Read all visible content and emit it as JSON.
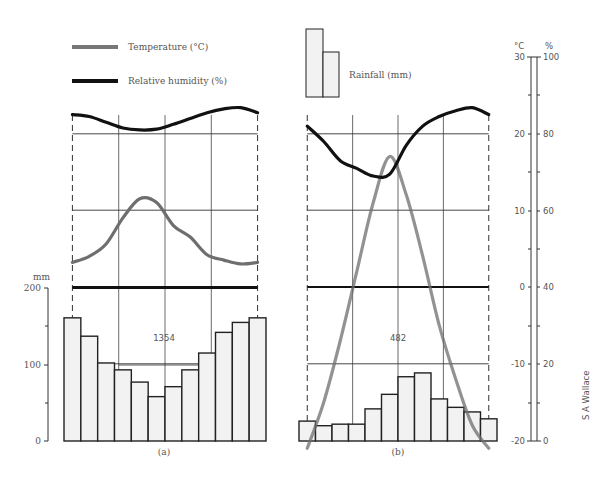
{
  "legend": {
    "temperature_label": "Temperature (°C)",
    "humidity_label": "Relative humidity (%)",
    "rainfall_label": "Rainfall (mm)"
  },
  "axes": {
    "left_unit": "mm",
    "left_ticks": [
      "200",
      "100",
      "0"
    ],
    "right_temp_unit": "°C",
    "right_hum_unit": "%",
    "right_temp_ticks": [
      "30",
      "20",
      "10",
      "0",
      "-10",
      "-20"
    ],
    "right_hum_ticks": [
      "100",
      "80",
      "60",
      "40",
      "20",
      "0"
    ]
  },
  "panels": [
    {
      "label": "(a)",
      "total_label": "1354"
    },
    {
      "label": "(b)",
      "total_label": "482"
    }
  ],
  "credit": "S A Wallace",
  "colors": {
    "temperature": "#6e6e6e",
    "humidity": "#111111",
    "bar_fill": "#f2f2f2",
    "bar_stroke": "#222222"
  },
  "chart_data": [
    {
      "type": "bar+line",
      "title": "(a)",
      "categories": [
        "J",
        "F",
        "M",
        "A",
        "M",
        "J",
        "J",
        "A",
        "S",
        "O",
        "N",
        "D"
      ],
      "annotation": "1354",
      "series": [
        {
          "name": "Rainfall (mm)",
          "type": "bar",
          "axis": "left",
          "values": [
            161,
            137,
            102,
            93,
            77,
            58,
            71,
            93,
            115,
            142,
            155,
            161
          ]
        },
        {
          "name": "Temperature (°C)",
          "type": "line",
          "axis": "right_temp",
          "values": [
            3.2,
            4,
            5.6,
            9,
            11.5,
            11,
            8,
            6.5,
            4.2,
            3.5,
            3,
            3.2
          ]
        },
        {
          "name": "Relative humidity (%)",
          "type": "line",
          "axis": "right_hum",
          "values": [
            85,
            84.5,
            83,
            81.5,
            81,
            81.2,
            82.5,
            84,
            85.5,
            86.5,
            86.8,
            85.5
          ]
        }
      ],
      "ylim_left": [
        0,
        200
      ],
      "ylim_right_temp": [
        -20,
        30
      ],
      "ylim_right_hum": [
        0,
        100
      ],
      "grid": true
    },
    {
      "type": "bar+line",
      "title": "(b)",
      "categories": [
        "J",
        "F",
        "M",
        "A",
        "M",
        "J",
        "J",
        "A",
        "S",
        "O",
        "N",
        "D"
      ],
      "annotation": "482",
      "series": [
        {
          "name": "Rainfall (mm)",
          "type": "bar",
          "axis": "left",
          "values": [
            26,
            20,
            22,
            22,
            42,
            61,
            84,
            89,
            55,
            44,
            38,
            29
          ]
        },
        {
          "name": "Temperature (°C)",
          "type": "line",
          "axis": "right_temp",
          "values": [
            -21,
            -15,
            -7,
            2,
            11,
            17,
            12,
            4,
            -5,
            -12,
            -18,
            -21
          ]
        },
        {
          "name": "Relative humidity (%)",
          "type": "line",
          "axis": "right_hum",
          "values": [
            82,
            78,
            73,
            71,
            69,
            69.5,
            77,
            82,
            84.5,
            86,
            86.8,
            85
          ]
        }
      ],
      "ylim_left": [
        0,
        200
      ],
      "ylim_right_temp": [
        -20,
        30
      ],
      "ylim_right_hum": [
        0,
        100
      ],
      "grid": true
    }
  ]
}
